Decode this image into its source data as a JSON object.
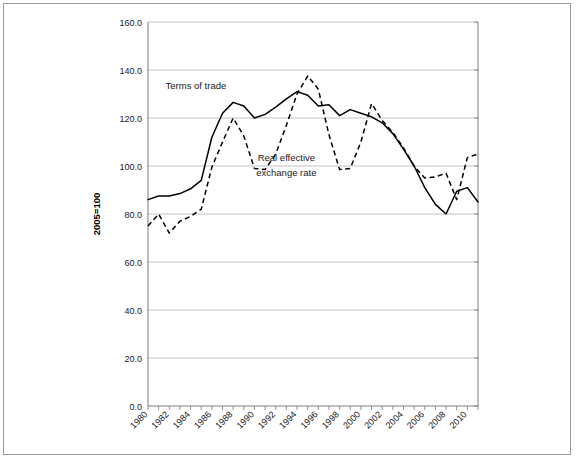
{
  "chart_data": {
    "type": "line",
    "title": "",
    "xlabel": "",
    "ylabel": "2005=100",
    "ylim": [
      0,
      160
    ],
    "ytick_step": 20,
    "yticks": [
      "0.0",
      "20.0",
      "40.0",
      "60.0",
      "80.0",
      "100.0",
      "120.0",
      "140.0",
      "160.0"
    ],
    "xlim": [
      1980,
      2011
    ],
    "xticks_labeled": [
      "1980",
      "1982",
      "1984",
      "1986",
      "1988",
      "1990",
      "1992",
      "1994",
      "1996",
      "1998",
      "2000",
      "2002",
      "2004",
      "2006",
      "2008",
      "2010"
    ],
    "xtick_interval_years": 1,
    "xlabel_interval_years": 2,
    "grid": "horizontal",
    "legend_position": "inline-annotations",
    "x": [
      1980,
      1981,
      1982,
      1983,
      1984,
      1985,
      1986,
      1987,
      1988,
      1989,
      1990,
      1991,
      1992,
      1993,
      1994,
      1995,
      1996,
      1997,
      1998,
      1999,
      2000,
      2001,
      2002,
      2003,
      2004,
      2005,
      2006,
      2007,
      2008,
      2009,
      2010,
      2011
    ],
    "series": [
      {
        "name": "Terms of trade",
        "style": "solid",
        "color": "#000000",
        "annotation": "Terms of trade",
        "values": [
          86.0,
          87.5,
          87.5,
          88.5,
          90.5,
          94.0,
          112.0,
          122.0,
          126.5,
          125.0,
          120.0,
          121.5,
          124.5,
          128.0,
          131.0,
          129.5,
          125.0,
          125.5,
          121.0,
          123.5,
          122.0,
          120.5,
          118.0,
          113.5,
          107.0,
          100.0,
          91.0,
          84.0,
          80.0,
          89.5,
          91.0,
          85.0
        ]
      },
      {
        "name": "Real effective exchange rate",
        "style": "dashed",
        "color": "#000000",
        "annotation": "Real effective\nexchange rate",
        "values": [
          75.0,
          80.0,
          72.0,
          77.0,
          79.0,
          82.0,
          99.5,
          110.0,
          120.0,
          112.5,
          99.0,
          98.5,
          105.0,
          117.0,
          130.0,
          137.5,
          132.0,
          113.0,
          98.5,
          99.0,
          110.0,
          126.0,
          119.0,
          114.0,
          107.5,
          100.0,
          95.0,
          95.5,
          97.0,
          86.0,
          103.5,
          105.0
        ]
      }
    ],
    "annotations": [
      {
        "text": "Terms of trade",
        "x_year": 1984.5,
        "y_value": 132.0
      },
      {
        "text": "Real effective",
        "x_year": 1993.0,
        "y_value": 102.0
      },
      {
        "text": "exchange rate",
        "x_year": 1993.0,
        "y_value": 96.0
      }
    ]
  }
}
